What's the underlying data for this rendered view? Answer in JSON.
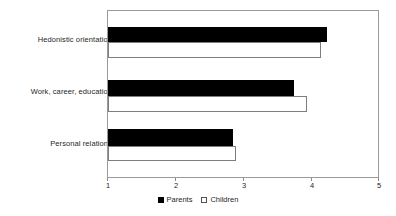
{
  "chart_data": {
    "type": "bar",
    "orientation": "horizontal",
    "title": "",
    "subtitle": "",
    "xlabel": "",
    "ylabel": "",
    "categories": [
      "Hedonistic orientation",
      "Work, career, education",
      "Personal relations"
    ],
    "series": [
      {
        "name": "Parents",
        "color": "#000000",
        "style": "filled",
        "values": [
          4.25,
          3.75,
          2.85
        ]
      },
      {
        "name": "Children",
        "color": "#ffffff",
        "style": "hollow",
        "values": [
          4.15,
          3.95,
          2.9
        ]
      }
    ],
    "xlim": [
      1,
      5
    ],
    "xticks": [
      1,
      2,
      3,
      4,
      5
    ],
    "xtick_labels": [
      "1",
      "2",
      "3",
      "4",
      "5"
    ],
    "grid": false,
    "legend_position": "bottom-center",
    "legend_entries": [
      "Parents",
      "Children"
    ],
    "frame": true
  },
  "axis": {
    "tick_labels": [
      "1",
      "2",
      "3",
      "4",
      "5"
    ]
  },
  "legend": {
    "parents_label": "Parents",
    "children_label": "Children"
  },
  "labels": {
    "cat0": "Hedonistic orientation",
    "cat1": "Work, career, education",
    "cat2": "Personal relations"
  }
}
